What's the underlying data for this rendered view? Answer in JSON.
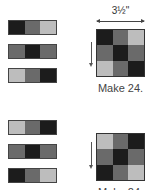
{
  "colors": {
    "dark": "#1c1c1c",
    "medium": "#6a6a6a",
    "light": "#bdbdbd"
  },
  "top_group": {
    "strips": [
      [
        "dark",
        "medium",
        "light"
      ],
      [
        "medium",
        "dark",
        "medium"
      ],
      [
        "light",
        "medium",
        "dark"
      ]
    ],
    "block": [
      [
        "dark",
        "medium",
        "light"
      ],
      [
        "medium",
        "dark",
        "medium"
      ],
      [
        "light",
        "medium",
        "dark"
      ]
    ],
    "dimension_label": "3½\"",
    "caption": "Make 24."
  },
  "bottom_group": {
    "strips": [
      [
        "light",
        "medium",
        "dark"
      ],
      [
        "medium",
        "dark",
        "medium"
      ],
      [
        "dark",
        "medium",
        "light"
      ]
    ],
    "block": [
      [
        "light",
        "medium",
        "dark"
      ],
      [
        "medium",
        "dark",
        "medium"
      ],
      [
        "dark",
        "medium",
        "light"
      ]
    ],
    "caption": "Make 24."
  }
}
